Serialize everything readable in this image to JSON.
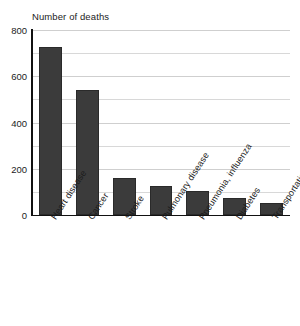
{
  "chart_data": {
    "type": "bar",
    "title": "Number of deaths",
    "xlabel": "",
    "ylabel": "",
    "ylim": [
      0,
      800
    ],
    "yticks": [
      0,
      200,
      400,
      600,
      800
    ],
    "yticks_minor": [
      100,
      300,
      500,
      700
    ],
    "grid": true,
    "legend": "none",
    "categories": [
      "Heart disease",
      "Cancer",
      "Stroke",
      "Pulmonary disease",
      "Pneumonia, influenza",
      "Diabetes",
      "Transportation accidents"
    ],
    "values": [
      725,
      540,
      160,
      125,
      105,
      73,
      50
    ],
    "bar_color": "#3b3b3b",
    "axis_color": "#111111",
    "grid_color": "#d8d8d8",
    "background": "#ffffff"
  }
}
